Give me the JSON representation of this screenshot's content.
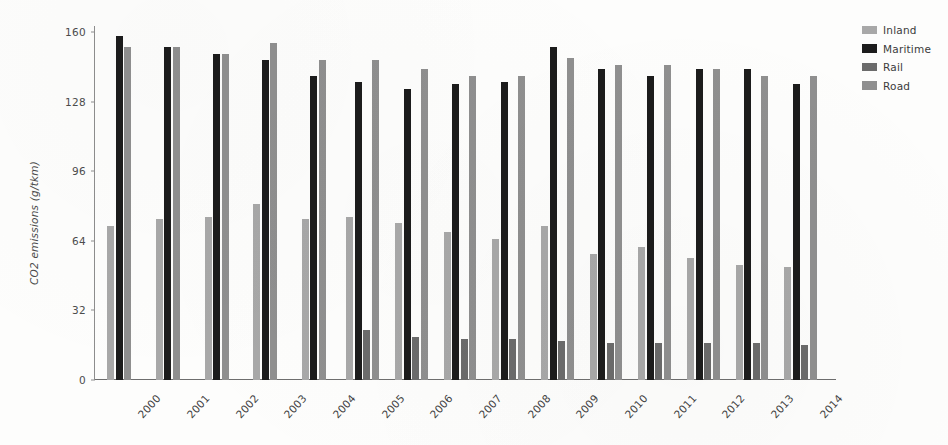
{
  "chart_data": {
    "type": "bar",
    "title": "",
    "xlabel": "",
    "ylabel": "CO2 emissions (g/tkm)",
    "ylim": [
      0,
      160
    ],
    "yticks": [
      0,
      32,
      64,
      96,
      128,
      160
    ],
    "grid": false,
    "legend_position": "right",
    "categories": [
      "2000",
      "2001",
      "2002",
      "2003",
      "2004",
      "2005",
      "2006",
      "2007",
      "2008",
      "2009",
      "2010",
      "2011",
      "2012",
      "2013",
      "2014"
    ],
    "series": [
      {
        "name": "Inland",
        "color": "#a8a8a8",
        "values": [
          71,
          74,
          75,
          81,
          74,
          75,
          72,
          68,
          65,
          71,
          58,
          61,
          56,
          53,
          52
        ]
      },
      {
        "name": "Maritime",
        "color": "#1c1c1c",
        "values": [
          158,
          153,
          150,
          147,
          140,
          137,
          134,
          136,
          137,
          153,
          143,
          140,
          143,
          143,
          136
        ]
      },
      {
        "name": "Rail",
        "color": "#6b6b6b",
        "values": [
          0,
          0,
          0,
          0,
          0,
          23,
          20,
          19,
          19,
          18,
          17,
          17,
          17,
          17,
          16
        ]
      },
      {
        "name": "Road",
        "color": "#8f8f8f",
        "values": [
          153,
          153,
          150,
          155,
          147,
          147,
          143,
          140,
          140,
          148,
          145,
          145,
          143,
          140,
          140
        ]
      }
    ]
  },
  "legend": {
    "items": [
      {
        "label": "Inland",
        "color": "#a8a8a8"
      },
      {
        "label": "Maritime",
        "color": "#1c1c1c"
      },
      {
        "label": "Rail",
        "color": "#6b6b6b"
      },
      {
        "label": "Road",
        "color": "#8f8f8f"
      }
    ]
  }
}
